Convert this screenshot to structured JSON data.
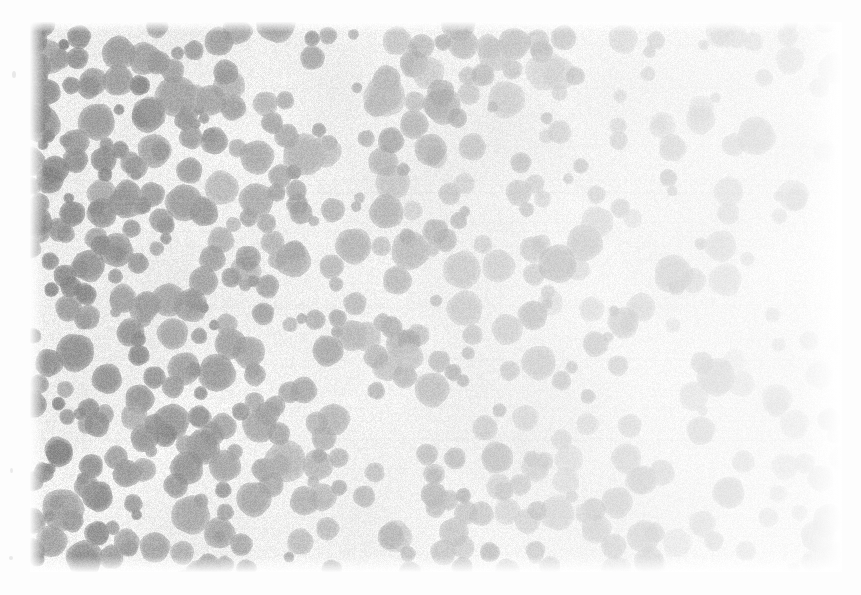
{
  "document": {
    "kind": "scanned-grayscale-micrograph",
    "title": "",
    "caption": "",
    "page_background": "#ffffff"
  },
  "plate": {
    "name": "micrograph-plate",
    "x": 30,
    "y": 22,
    "width": 812,
    "height": 550,
    "background": "#f7f7f6",
    "description": "Dense field of rounded stained particles on a pale grainy background"
  },
  "image_stats": {
    "background_color": "#f4f4f3",
    "particle_color_dark": "#8e8e8e",
    "particle_color_mid": "#a9a9a9",
    "particle_color_light": "#c9c9c9",
    "particle_count": 560,
    "min_radius_px": 6,
    "max_radius_px": 23,
    "mean_radius_px": 13,
    "exposure": "left-dark to right-light gradient",
    "grain": "fine film grain",
    "seed": 20240917
  },
  "margin_specks": [
    {
      "name": "speck-upper-left",
      "x": 12,
      "y": 71,
      "w": 4,
      "h": 7
    },
    {
      "name": "speck-mid-left",
      "x": 10,
      "y": 468,
      "w": 3,
      "h": 5
    },
    {
      "name": "speck-lower-left",
      "x": 9,
      "y": 556,
      "w": 4,
      "h": 4
    }
  ],
  "chart_data": {
    "type": "heatmap",
    "title": "",
    "xlabel": "",
    "ylabel": "",
    "grid": false,
    "legend": "none",
    "xlim": [
      0,
      812
    ],
    "ylim": [
      0,
      550
    ],
    "density_profile_x": {
      "bins": [
        "0-100",
        "100-200",
        "200-300",
        "300-400",
        "400-500",
        "500-600",
        "600-700",
        "700-812"
      ],
      "values": [
        95,
        92,
        88,
        84,
        76,
        66,
        55,
        42
      ]
    },
    "optical_density_profile_x": {
      "bins": [
        "0-100",
        "100-200",
        "200-300",
        "300-400",
        "400-500",
        "500-600",
        "600-700",
        "700-812"
      ],
      "values": [
        0.46,
        0.44,
        0.41,
        0.37,
        0.31,
        0.25,
        0.19,
        0.13
      ]
    }
  }
}
